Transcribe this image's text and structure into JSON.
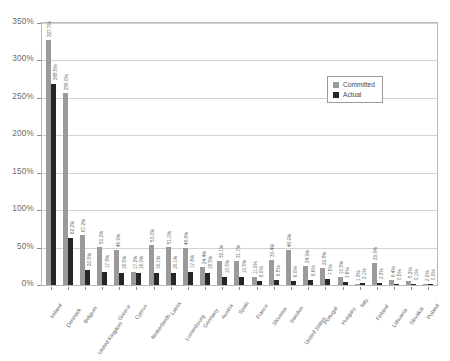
{
  "chart_data": {
    "type": "bar",
    "title": "",
    "subtitle": "",
    "xlabel": "",
    "ylabel": "",
    "ylim": [
      0,
      350
    ],
    "ytick_labels": [
      "0%",
      "50%",
      "100%",
      "150%",
      "200%",
      "250%",
      "300%",
      "350%"
    ],
    "ytick_values": [
      0,
      50,
      100,
      150,
      200,
      250,
      300,
      350
    ],
    "grid": true,
    "legend_position": "upper-right",
    "categories": [
      "Ireland",
      "Denmark",
      "Belgium",
      "United Kingdom",
      "Greece",
      "Cyprus",
      "Netherlands",
      "Latvia",
      "Luxembourg",
      "Germany",
      "Austria",
      "Spain",
      "France",
      "Slovenia",
      "Sweden",
      "United States",
      "Portugal",
      "Hungary",
      "Italy",
      "Finland",
      "Lithuania",
      "Slovakia",
      "Poland"
    ],
    "series": [
      {
        "name": "Committed",
        "color": "#9a9a9a",
        "values": [
          327.7,
          256.0,
          67.2,
          50.2,
          46.9,
          17.2,
          53.0,
          51.0,
          48.8,
          24.4,
          32.1,
          31.7,
          11.0,
          33.4,
          46.9,
          24.9,
          22.8,
          10.5,
          1.3,
          29.9,
          6.4,
          5.2,
          2.0
        ],
        "labels": [
          "327.7%",
          "256.0%",
          "67.2%",
          "50.2%",
          "46.9%",
          "17.2%",
          "53.0%",
          "51.0%",
          "48.8%",
          "24.4%",
          "32.1%",
          "31.7%",
          "11.0%",
          "33.4%",
          "46.9%",
          "24.9%",
          "22.8%",
          "10.5%",
          "1.3%",
          "29.9%",
          "6.4%",
          "5.2%",
          "2.0%"
        ]
      },
      {
        "name": "Actual",
        "color": "#262626",
        "values": [
          268.5,
          62.2,
          20.5,
          17.8,
          16.5,
          16.0,
          16.1,
          16.1,
          17.6,
          16.5,
          10.5,
          10.5,
          6.0,
          6.5,
          6.0,
          6.6,
          7.5,
          3.6,
          2.1,
          2.3,
          0.5,
          0.1,
          0.0
        ],
        "labels": [
          "268.5%",
          "62.2%",
          "20.5%",
          "17.8%",
          "16.5%",
          "16.0%",
          "16.1%",
          "16.1%",
          "17.6%",
          "16.5%",
          "10.5%",
          "10.5%",
          "6.0%",
          "6.5%",
          "6.0%",
          "6.6%",
          "7.5%",
          "3.6%",
          "2.1%",
          "2.3%",
          "0.5%",
          "0.1%",
          "0.0%"
        ]
      }
    ]
  },
  "legend": {
    "items": [
      {
        "label": "Committed"
      },
      {
        "label": "Actual"
      }
    ]
  }
}
